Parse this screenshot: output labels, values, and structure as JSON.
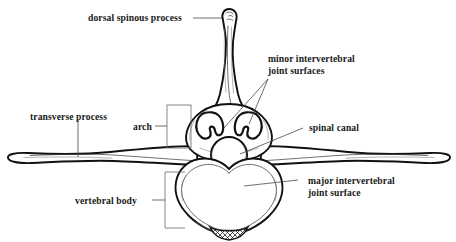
{
  "figure": {
    "subject": "vertebra",
    "view": "cranial/axial view",
    "background_color": "#ffffff",
    "outline_color": "#111111",
    "text_color": "#1a1a1a",
    "leader_color": "#4a4a4a"
  },
  "labels": {
    "dorsal_spinous_process": "dorsal spinous process",
    "minor_joint_line1": "minor intervertebral",
    "minor_joint_line2": "joint surfaces",
    "transverse_process": "transverse process",
    "arch": "arch",
    "spinal_canal": "spinal canal",
    "major_joint_line1": "major intervertebral",
    "major_joint_line2": "joint surface",
    "vertebral_body": "vertebral body"
  },
  "structures": [
    {
      "name": "dorsal-spinous-process",
      "label": "dorsal spinous process",
      "description": "vertical process with rounded knob at top, flaring base"
    },
    {
      "name": "minor-intervertebral-joint-surfaces",
      "label": "minor intervertebral joint surfaces",
      "description": "paired crescent-shaped facets flanking the spinous process base",
      "count": 2
    },
    {
      "name": "transverse-process",
      "label": "transverse process",
      "description": "long lateral tapering wing, left and right",
      "count": 2
    },
    {
      "name": "arch",
      "label": "arch",
      "description": "vertebral arch region indicated by rectangular bracket"
    },
    {
      "name": "spinal-canal",
      "label": "spinal canal",
      "description": "central circular opening"
    },
    {
      "name": "major-intervertebral-joint-surface",
      "label": "major intervertebral joint surface",
      "description": "heart-shaped anterior body surface"
    },
    {
      "name": "vertebral-body",
      "label": "vertebral body",
      "description": "large heart-shaped mass with cross-hatched ventral keel"
    }
  ]
}
